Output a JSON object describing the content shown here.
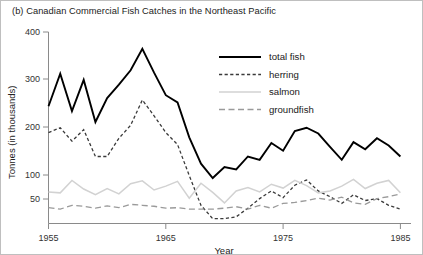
{
  "figure": {
    "title": "(b) Canadian Commercial Fish Catches in the Northeast Pacific"
  },
  "axes": {
    "y_title": "Tonnes (in thousands)",
    "x_title": "Year",
    "y_ticks": [
      "400",
      "300",
      "200",
      "100",
      "50"
    ],
    "x_ticks": [
      "1955",
      "1965",
      "1975",
      "1985"
    ]
  },
  "legend": {
    "items": [
      {
        "label": "total fish",
        "style": "solid-thick",
        "color": "#000000"
      },
      {
        "label": "herring",
        "style": "dashed-fine",
        "color": "#3a3a3a"
      },
      {
        "label": "salmon",
        "style": "solid-light",
        "color": "#d2d2d2"
      },
      {
        "label": "groundfish",
        "style": "dashed-long",
        "color": "#9a9a9a"
      }
    ]
  },
  "chart_data": {
    "type": "line",
    "title": "(b) Canadian Commercial Fish Catches in the Northeast Pacific",
    "xlabel": "Year",
    "ylabel": "Tonnes (in thousands)",
    "xlim": [
      1955,
      1985
    ],
    "ylim": [
      0,
      400
    ],
    "yticks": [
      50,
      100,
      200,
      300,
      400
    ],
    "xticks": [
      1955,
      1965,
      1975,
      1985
    ],
    "grid": false,
    "legend_position": "upper-center-right",
    "x": [
      1955,
      1956,
      1957,
      1958,
      1959,
      1960,
      1961,
      1962,
      1963,
      1964,
      1965,
      1966,
      1967,
      1968,
      1969,
      1970,
      1971,
      1972,
      1973,
      1974,
      1975,
      1976,
      1977,
      1978,
      1979,
      1980,
      1981,
      1982,
      1983,
      1984,
      1985
    ],
    "series": [
      {
        "name": "total fish",
        "color": "#000000",
        "style": "solid-thick",
        "values": [
          245,
          313,
          235,
          300,
          212,
          262,
          290,
          320,
          365,
          315,
          268,
          253,
          180,
          125,
          95,
          118,
          113,
          140,
          133,
          168,
          152,
          193,
          200,
          188,
          160,
          133,
          170,
          155,
          178,
          163,
          140
        ]
      },
      {
        "name": "herring",
        "color": "#3a3a3a",
        "style": "dashed-fine",
        "values": [
          190,
          200,
          172,
          196,
          140,
          140,
          178,
          205,
          258,
          225,
          190,
          165,
          100,
          38,
          10,
          10,
          14,
          32,
          52,
          68,
          54,
          80,
          91,
          68,
          56,
          42,
          60,
          48,
          52,
          38,
          30
        ]
      },
      {
        "name": "salmon",
        "color": "#d2d2d2",
        "style": "solid-light",
        "values": [
          66,
          64,
          90,
          72,
          60,
          73,
          62,
          83,
          89,
          70,
          78,
          88,
          53,
          84,
          65,
          43,
          68,
          75,
          66,
          82,
          74,
          90,
          79,
          64,
          68,
          78,
          92,
          73,
          84,
          90,
          64
        ]
      },
      {
        "name": "groundfish",
        "color": "#9a9a9a",
        "style": "dashed-long",
        "values": [
          33,
          30,
          38,
          36,
          32,
          37,
          33,
          40,
          38,
          36,
          32,
          33,
          30,
          30,
          30,
          32,
          35,
          30,
          38,
          32,
          42,
          44,
          48,
          53,
          49,
          55,
          43,
          40,
          52,
          56,
          62
        ]
      }
    ]
  }
}
